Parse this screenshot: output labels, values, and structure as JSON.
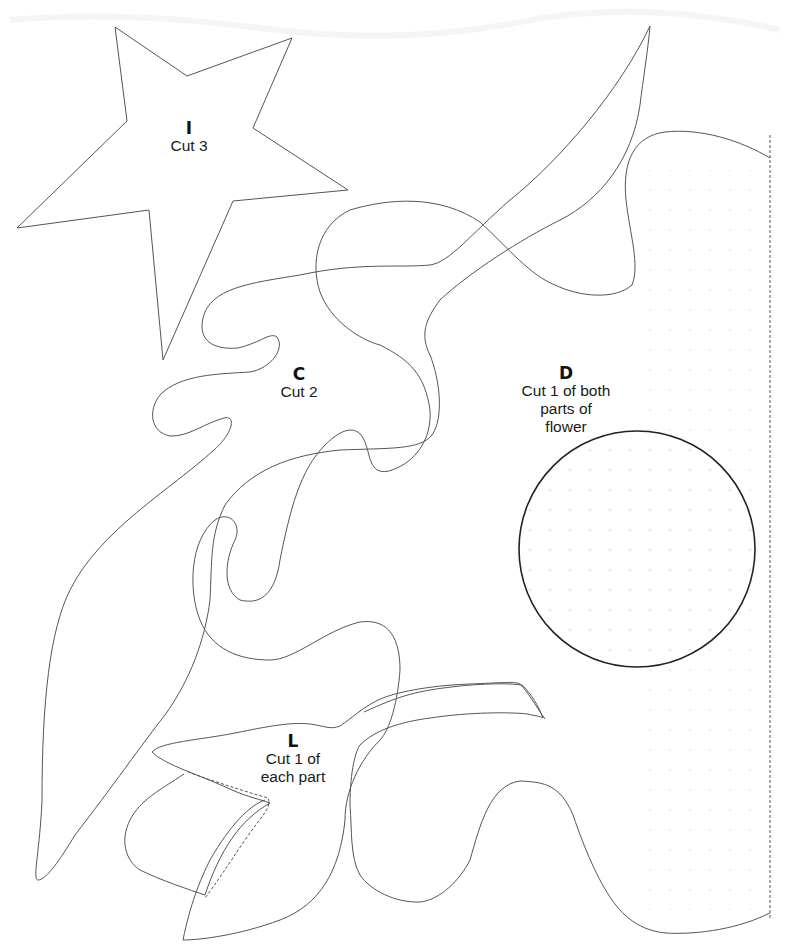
{
  "document": {
    "type": "sewing-pattern-page",
    "fold_line": {
      "style": "dashed",
      "x": 770
    }
  },
  "pieces": [
    {
      "id": "I",
      "letter": "I",
      "instruction": "Cut 3",
      "shape": "star"
    },
    {
      "id": "C",
      "letter": "C",
      "instruction": "Cut 2",
      "shape": "wavy-flame"
    },
    {
      "id": "D",
      "letter": "D",
      "instruction_lines": [
        "Cut 1 of both",
        "parts of",
        "flower"
      ],
      "shape": "flower-half-and-circle"
    },
    {
      "id": "L",
      "letter": "L",
      "instruction_lines": [
        "Cut 1 of",
        "each part"
      ],
      "shape": "leaf-pieces"
    }
  ],
  "labels": {
    "I": {
      "letter": "I",
      "line1": "Cut 3"
    },
    "C": {
      "letter": "C",
      "line1": "Cut 2"
    },
    "D": {
      "letter": "D",
      "line1": "Cut 1 of both",
      "line2": "parts of",
      "line3": "flower"
    },
    "L": {
      "letter": "L",
      "line1": "Cut 1 of",
      "line2": "each part"
    }
  },
  "colors": {
    "outline": "#4a4a4a",
    "circle_outline": "#222222",
    "dots": "#e6e6e6",
    "background": "#ffffff"
  }
}
